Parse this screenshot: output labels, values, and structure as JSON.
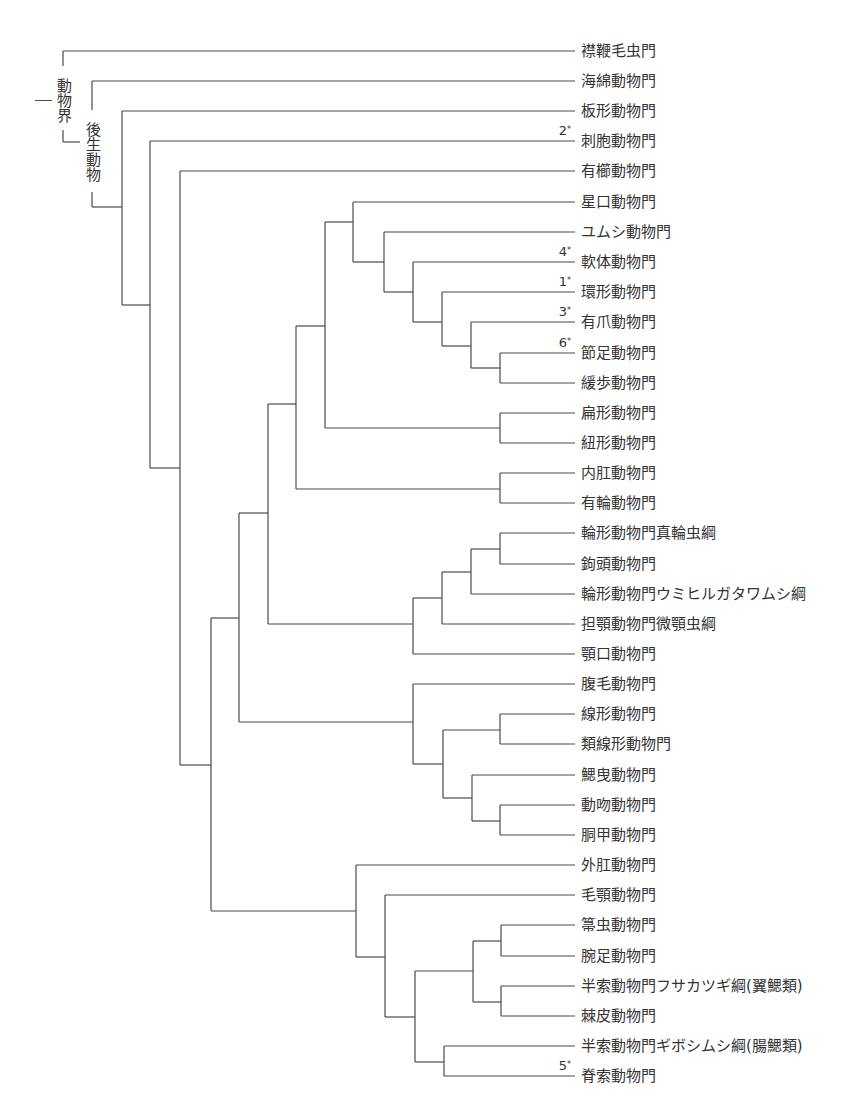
{
  "diagram": {
    "type": "phylogenetic-tree",
    "group_labels": {
      "kingdom": "動物界",
      "metazoa": "後生動物"
    },
    "leaf_x_end": 575,
    "label_x": 581,
    "leaves": [
      {
        "label": "襟鞭毛虫門",
        "note": ""
      },
      {
        "label": "海綿動物門",
        "note": ""
      },
      {
        "label": "板形動物門",
        "note": ""
      },
      {
        "label": "刺胞動物門",
        "note": "2"
      },
      {
        "label": "有櫛動物門",
        "note": ""
      },
      {
        "label": "星口動物門",
        "note": ""
      },
      {
        "label": "ユムシ動物門",
        "note": ""
      },
      {
        "label": "軟体動物門",
        "note": "4"
      },
      {
        "label": "環形動物門",
        "note": "1"
      },
      {
        "label": "有爪動物門",
        "note": "3"
      },
      {
        "label": "節足動物門",
        "note": "6"
      },
      {
        "label": "緩歩動物門",
        "note": ""
      },
      {
        "label": " 扁形動物門",
        "note": ""
      },
      {
        "label": "紐形動物門",
        "note": ""
      },
      {
        "label": "内肛動物門",
        "note": ""
      },
      {
        "label": "有輪動物門",
        "note": ""
      },
      {
        "label": "輪形動物門真輪虫綱",
        "note": ""
      },
      {
        "label": "鉤頭動物門",
        "note": ""
      },
      {
        "label": "輪形動物門ウミヒルガタワムシ綱",
        "note": ""
      },
      {
        "label": "担顎動物門微顎虫綱",
        "note": ""
      },
      {
        "label": "顎口動物門",
        "note": ""
      },
      {
        "label": "腹毛動物門",
        "note": ""
      },
      {
        "label": "線形動物門",
        "note": ""
      },
      {
        "label": "類線形動物門",
        "note": ""
      },
      {
        "label": "鰓曳動物門",
        "note": ""
      },
      {
        "label": "動吻動物門",
        "note": ""
      },
      {
        "label": "胴甲動物門",
        "note": ""
      },
      {
        "label": "外肛動物門",
        "note": ""
      },
      {
        "label": "毛顎動物門",
        "note": ""
      },
      {
        "label": "箒虫動物門",
        "note": ""
      },
      {
        "label": "腕足動物門",
        "note": ""
      },
      {
        "label": "半索動物門フサカツギ綱(翼鰓類)",
        "note": ""
      },
      {
        "label": "棘皮動物門",
        "note": ""
      },
      {
        "label": "半索動物門ギボシムシ綱(腸鰓類)",
        "note": ""
      },
      {
        "label": "脊索動物門",
        "note": "5"
      }
    ],
    "row_y": [
      51,
      81,
      111,
      141,
      171,
      202,
      232,
      262,
      292,
      322,
      353,
      383,
      413,
      443,
      473,
      503,
      533,
      564,
      594,
      624,
      654,
      684,
      714,
      744,
      775,
      805,
      835,
      865,
      895,
      925,
      956,
      986,
      1016,
      1046,
      1076
    ],
    "leaf_start_x": [
      63,
      92,
      122,
      150,
      180,
      353,
      384,
      413,
      442,
      471,
      500,
      500,
      500,
      500,
      500,
      500,
      500,
      500,
      471,
      442,
      413,
      413,
      500,
      500,
      472,
      500,
      500,
      356,
      385,
      501,
      501,
      501,
      501,
      444,
      444
    ],
    "internal_nodes": [
      {
        "x": 122,
        "y1": 111,
        "y2": 305,
        "join_to_x": 150,
        "join_y": 305
      },
      {
        "x": 150,
        "y1": 141,
        "y2": 468,
        "join_to_x": 180,
        "join_y": 468
      },
      {
        "x": 180,
        "y1": 171,
        "y2": 765,
        "join_to_x": 211,
        "join_y": 765
      },
      {
        "x": 211,
        "y1": 618,
        "y2": 911,
        "join_to_x": 211,
        "join_y": 765
      },
      {
        "x": 239,
        "y1": 513,
        "y2": 722,
        "join_to_x": 211,
        "join_y": 618
      },
      {
        "x": 268,
        "y1": 404,
        "y2": 624,
        "join_to_x": 239,
        "join_y": 513
      },
      {
        "x": 296,
        "y1": 326,
        "y2": 489,
        "join_to_x": 268,
        "join_y": 404
      },
      {
        "x": 325,
        "y1": 222,
        "y2": 428,
        "join_to_x": 296,
        "join_y": 326
      },
      {
        "x": 353,
        "y1": 202,
        "y2": 262,
        "join_to_x": 325,
        "join_y": 222
      },
      {
        "x": 384,
        "y1": 232,
        "y2": 292,
        "join_to_x": 353,
        "join_y": 262
      },
      {
        "x": 413,
        "y1": 262,
        "y2": 322,
        "join_to_x": 384,
        "join_y": 292
      },
      {
        "x": 442,
        "y1": 292,
        "y2": 346,
        "join_to_x": 413,
        "join_y": 322
      },
      {
        "x": 471,
        "y1": 322,
        "y2": 368,
        "join_to_x": 442,
        "join_y": 346
      },
      {
        "x": 500,
        "y1": 353,
        "y2": 383,
        "join_to_x": 471,
        "join_y": 368
      },
      {
        "x": 500,
        "y1": 413,
        "y2": 443,
        "join_to_x": 325,
        "join_y": 428
      },
      {
        "x": 500,
        "y1": 473,
        "y2": 503,
        "join_to_x": 296,
        "join_y": 489
      },
      {
        "x": 500,
        "y1": 533,
        "y2": 564,
        "join_to_x": 471,
        "join_y": 549
      },
      {
        "x": 471,
        "y1": 549,
        "y2": 594,
        "join_to_x": 442,
        "join_y": 572
      },
      {
        "x": 442,
        "y1": 572,
        "y2": 624,
        "join_to_x": 413,
        "join_y": 598
      },
      {
        "x": 413,
        "y1": 598,
        "y2": 654,
        "join_to_x": 268,
        "join_y": 624
      },
      {
        "x": 413,
        "y1": 684,
        "y2": 764,
        "join_to_x": 239,
        "join_y": 722
      },
      {
        "x": 443,
        "y1": 730,
        "y2": 798,
        "join_to_x": 413,
        "join_y": 764
      },
      {
        "x": 500,
        "y1": 714,
        "y2": 744,
        "join_to_x": 443,
        "join_y": 730
      },
      {
        "x": 472,
        "y1": 775,
        "y2": 821,
        "join_to_x": 443,
        "join_y": 798
      },
      {
        "x": 500,
        "y1": 805,
        "y2": 835,
        "join_to_x": 472,
        "join_y": 821
      },
      {
        "x": 356,
        "y1": 865,
        "y2": 957,
        "join_to_x": 211,
        "join_y": 911
      },
      {
        "x": 385,
        "y1": 895,
        "y2": 1017,
        "join_to_x": 356,
        "join_y": 957
      },
      {
        "x": 415,
        "y1": 971,
        "y2": 1062,
        "join_to_x": 385,
        "join_y": 1017
      },
      {
        "x": 473,
        "y1": 941,
        "y2": 1002,
        "join_to_x": 415,
        "join_y": 971
      },
      {
        "x": 501,
        "y1": 925,
        "y2": 956,
        "join_to_x": 473,
        "join_y": 941
      },
      {
        "x": 501,
        "y1": 986,
        "y2": 1016,
        "join_to_x": 473,
        "join_y": 1002
      },
      {
        "x": 444,
        "y1": 1046,
        "y2": 1076,
        "join_to_x": 415,
        "join_y": 1062
      }
    ],
    "colors": {
      "line": "#4a4a4a",
      "text": "#333333",
      "background": "#ffffff"
    }
  }
}
